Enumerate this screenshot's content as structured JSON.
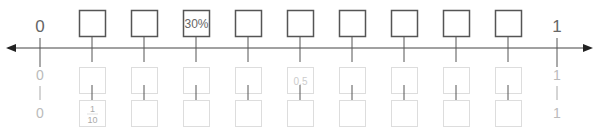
{
  "axis": {
    "left_label": "0",
    "right_label": "1"
  },
  "rows": [
    {
      "name": "top",
      "start_label": "0",
      "end_label": "1",
      "faded": false,
      "boxes": [
        "",
        "",
        "30%",
        "",
        "",
        "",
        "",
        "",
        ""
      ]
    },
    {
      "name": "middle",
      "start_label": "0",
      "end_label": "1",
      "faded": true,
      "boxes": [
        "",
        "",
        "",
        "",
        "0.5",
        "",
        "",
        "",
        ""
      ]
    },
    {
      "name": "bottom",
      "start_label": "0",
      "end_label": "1",
      "faded": true,
      "boxes": [
        {
          "numerator": "1",
          "denominator": "10"
        },
        "",
        "",
        "",
        "",
        "",
        "",
        "",
        ""
      ]
    }
  ],
  "colors": {
    "dark_stroke": "#555555",
    "faded_stroke": "#dddddd",
    "dark_text": "#666666",
    "faded_text": "#cccccc",
    "axis": "#444444"
  }
}
